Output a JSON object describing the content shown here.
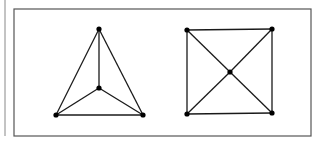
{
  "figure": {
    "colors": {
      "line": "#1a1a1a",
      "node": "#000000",
      "frame": "#555555",
      "margin_line": "#888888",
      "background": "#ffffff"
    },
    "margin_line": {
      "x": 5,
      "y1": 0,
      "y2": 136
    },
    "frame": {
      "x": 14,
      "y": 9,
      "width": 297,
      "height": 127
    },
    "graphs": [
      {
        "name": "left-graph",
        "label": "K4 drawn as triangle with interior vertex",
        "nodes": [
          {
            "id": "top",
            "x": 99,
            "y": 29
          },
          {
            "id": "center",
            "x": 99,
            "y": 88
          },
          {
            "id": "bottom-left",
            "x": 56,
            "y": 115
          },
          {
            "id": "bottom-right",
            "x": 143,
            "y": 115
          }
        ],
        "edges": [
          [
            "top",
            "bottom-left"
          ],
          [
            "top",
            "bottom-right"
          ],
          [
            "bottom-left",
            "bottom-right"
          ],
          [
            "top",
            "center"
          ],
          [
            "center",
            "bottom-left"
          ],
          [
            "center",
            "bottom-right"
          ]
        ]
      },
      {
        "name": "right-graph",
        "label": "Square with both diagonals and center vertex",
        "nodes": [
          {
            "id": "top-left",
            "x": 187,
            "y": 30
          },
          {
            "id": "top-right",
            "x": 272,
            "y": 29
          },
          {
            "id": "bottom-left",
            "x": 187,
            "y": 114
          },
          {
            "id": "bottom-right",
            "x": 272,
            "y": 113
          },
          {
            "id": "center",
            "x": 230,
            "y": 72
          }
        ],
        "edges": [
          [
            "top-left",
            "top-right"
          ],
          [
            "top-right",
            "bottom-right"
          ],
          [
            "bottom-right",
            "bottom-left"
          ],
          [
            "bottom-left",
            "top-left"
          ],
          [
            "top-left",
            "center"
          ],
          [
            "center",
            "bottom-right"
          ],
          [
            "top-right",
            "center"
          ],
          [
            "center",
            "bottom-left"
          ]
        ]
      }
    ]
  }
}
